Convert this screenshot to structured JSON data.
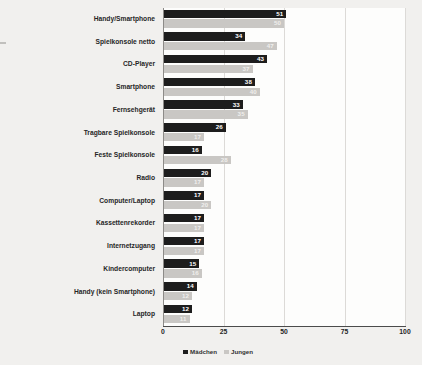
{
  "chart_data": {
    "type": "bar",
    "orientation": "horizontal",
    "title": "",
    "xlabel": "",
    "ylabel": "",
    "xlim": [
      0,
      100
    ],
    "xticks": [
      "0",
      "25",
      "50",
      "75",
      "100"
    ],
    "grid": true,
    "legend_position": "bottom-left",
    "categories": [
      "Handy/Smartphone",
      "Spielkonsole netto",
      "CD-Player",
      "Smartphone",
      "Fernsehgerät",
      "Tragbare Spielkonsole",
      "Feste Spielkonsole",
      "Radio",
      "Computer/Laptop",
      "Kassettenrekorder",
      "Internetzugang",
      "Kindercomputer",
      "Handy (kein Smartphone)",
      "Laptop"
    ],
    "series": [
      {
        "name": "Mädchen",
        "color": "#1d1d1d",
        "values": [
          51,
          34,
          43,
          38,
          33,
          26,
          16,
          20,
          17,
          17,
          17,
          15,
          14,
          12
        ]
      },
      {
        "name": "Jungen",
        "color": "#c9c7c4",
        "values": [
          50,
          47,
          37,
          40,
          35,
          17,
          28,
          17,
          20,
          17,
          17,
          16,
          12,
          11
        ]
      }
    ]
  },
  "legend": {
    "items": [
      {
        "label": "Mädchen",
        "color": "#1d1d1d"
      },
      {
        "label": "Jungen",
        "color": "#c9c7c4"
      }
    ]
  }
}
